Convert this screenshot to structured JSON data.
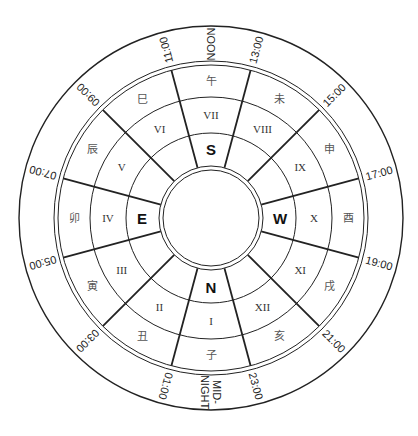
{
  "diagram": {
    "center": {
      "x": 211,
      "y": 218
    },
    "rings": [
      192,
      157,
      153,
      121,
      85,
      52,
      48
    ],
    "segments": [
      {
        "branch": "午",
        "roman": "VII",
        "cardinal": "S"
      },
      {
        "branch": "未",
        "roman": "VIII",
        "cardinal": ""
      },
      {
        "branch": "申",
        "roman": "IX",
        "cardinal": ""
      },
      {
        "branch": "酉",
        "roman": "X",
        "cardinal": "W"
      },
      {
        "branch": "戌",
        "roman": "XI",
        "cardinal": ""
      },
      {
        "branch": "亥",
        "roman": "XII",
        "cardinal": ""
      },
      {
        "branch": "子",
        "roman": "I",
        "cardinal": "N"
      },
      {
        "branch": "丑",
        "roman": "II",
        "cardinal": ""
      },
      {
        "branch": "寅",
        "roman": "III",
        "cardinal": ""
      },
      {
        "branch": "卯",
        "roman": "IV",
        "cardinal": "E"
      },
      {
        "branch": "辰",
        "roman": "V",
        "cardinal": ""
      },
      {
        "branch": "巳",
        "roman": "VI",
        "cardinal": ""
      }
    ],
    "time_labels": [
      {
        "text": "NOON",
        "angle": 0
      },
      {
        "text": "13:00",
        "angle": 15
      },
      {
        "text": "15:00",
        "angle": 45
      },
      {
        "text": "17:00",
        "angle": 75
      },
      {
        "text": "19:00",
        "angle": 105
      },
      {
        "text": "21:00",
        "angle": 135
      },
      {
        "text": "23:00",
        "angle": 165
      },
      {
        "text": "MID-NIGHT",
        "angle": 180
      },
      {
        "text": "01:00",
        "angle": 195
      },
      {
        "text": "03:00",
        "angle": 225
      },
      {
        "text": "05:00",
        "angle": 255
      },
      {
        "text": "07:00",
        "angle": 285
      },
      {
        "text": "09:00",
        "angle": 315
      },
      {
        "text": "11:00",
        "angle": 345
      }
    ],
    "midnight_lines": [
      "MID-",
      "NIGHT"
    ]
  }
}
